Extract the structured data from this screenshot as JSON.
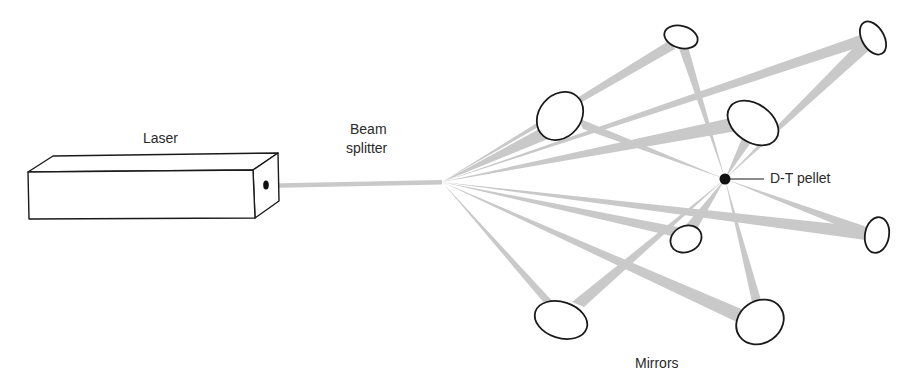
{
  "diagram": {
    "type": "schematic",
    "labels": {
      "laser": "Laser",
      "beam_splitter_line1": "Beam",
      "beam_splitter_line2": "splitter",
      "pellet": "D-T pellet",
      "mirrors": "Mirrors"
    },
    "colors": {
      "beam": "#c9c9c9",
      "outline": "#1a1a1a",
      "pellet": "#111111",
      "text": "#2a2a2a"
    },
    "components": {
      "laser": {
        "shape": "rectangular box"
      },
      "beam_splitter": {
        "x": 442,
        "y": 182
      },
      "pellet": {
        "x": 725,
        "y": 179
      },
      "mirrors": [
        {
          "id": "A",
          "x": 560,
          "y": 116
        },
        {
          "id": "B",
          "x": 681,
          "y": 37
        },
        {
          "id": "C",
          "x": 873,
          "y": 38
        },
        {
          "id": "D",
          "x": 753,
          "y": 123
        },
        {
          "id": "E",
          "x": 686,
          "y": 239
        },
        {
          "id": "F",
          "x": 877,
          "y": 235
        },
        {
          "id": "G",
          "x": 561,
          "y": 320
        },
        {
          "id": "H",
          "x": 760,
          "y": 322
        }
      ],
      "mirror_count": 8
    }
  }
}
